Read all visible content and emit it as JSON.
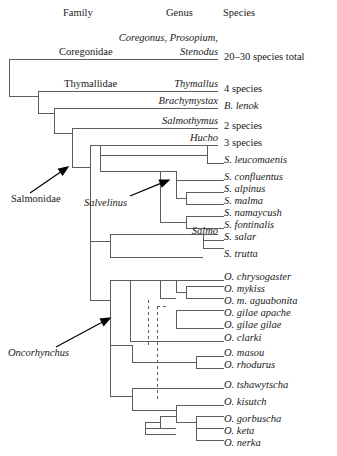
{
  "figure": {
    "width": 337,
    "height": 456,
    "line_color": "#5c5c5c",
    "arrow_color": "#000000",
    "text_color": "#1a1a1a"
  },
  "headers": [
    {
      "label": "Family",
      "x": 63,
      "y": 16
    },
    {
      "label": "Genus",
      "x": 166,
      "y": 16
    },
    {
      "label": "Species",
      "x": 223,
      "y": 16
    }
  ],
  "family_labels": [
    {
      "label": "Coregonidae",
      "x": 59,
      "y": 55
    },
    {
      "label": "Thymallidae",
      "x": 64,
      "y": 87
    }
  ],
  "genus_labels": [
    {
      "label": "Coregonus, Prosopium,",
      "x": 218,
      "y": 41,
      "anchor": "end"
    },
    {
      "label": "Stenodus",
      "x": 218,
      "y": 55,
      "anchor": "end"
    },
    {
      "label": "Thymallus",
      "x": 218,
      "y": 87,
      "anchor": "end"
    },
    {
      "label": "Brachymystax",
      "x": 218,
      "y": 104,
      "anchor": "end"
    },
    {
      "label": "Salmothymus",
      "x": 218,
      "y": 124,
      "anchor": "end"
    },
    {
      "label": "Hucho",
      "x": 218,
      "y": 141,
      "anchor": "end"
    },
    {
      "label": "Salmo",
      "x": 218,
      "y": 234,
      "anchor": "end"
    }
  ],
  "underlines": [
    {
      "x1": 9,
      "x2": 218,
      "y": 59
    },
    {
      "x1": 38,
      "x2": 218,
      "y": 91
    },
    {
      "x1": 54,
      "x2": 218,
      "y": 108
    },
    {
      "x1": 72,
      "x2": 218,
      "y": 128
    },
    {
      "x1": 100,
      "x2": 218,
      "y": 145
    }
  ],
  "species_labels": [
    {
      "label": "20–30 species total",
      "y": 60,
      "style": "count"
    },
    {
      "label": "4 species",
      "y": 92,
      "style": "count"
    },
    {
      "label": "B. lenok",
      "y": 109,
      "style": "species"
    },
    {
      "label": "2 species",
      "y": 129,
      "style": "count"
    },
    {
      "label": "3 species",
      "y": 146,
      "style": "count"
    },
    {
      "label": "S. leucomaenis",
      "y": 163,
      "style": "species"
    },
    {
      "label": "S. confluentus",
      "y": 180,
      "style": "species"
    },
    {
      "label": "S. alpinus",
      "y": 192,
      "style": "species"
    },
    {
      "label": "S. malma",
      "y": 204,
      "style": "species"
    },
    {
      "label": "S. namaycush",
      "y": 216,
      "style": "species"
    },
    {
      "label": "S. fontinalis",
      "y": 228,
      "style": "species"
    },
    {
      "label": "S. salar",
      "y": 240,
      "style": "species"
    },
    {
      "label": "S. trutta",
      "y": 257,
      "style": "species"
    },
    {
      "label": "O. chrysogaster",
      "y": 280,
      "style": "species"
    },
    {
      "label": "O. mykiss",
      "y": 292,
      "style": "species"
    },
    {
      "label": "O. m. aguabonita",
      "y": 304,
      "style": "species"
    },
    {
      "label": "O. gilae apache",
      "y": 316,
      "style": "species"
    },
    {
      "label": "O. gilae gilae",
      "y": 328,
      "style": "species"
    },
    {
      "label": "O. clarki",
      "y": 341,
      "style": "species"
    },
    {
      "label": "O. masou",
      "y": 356,
      "style": "species"
    },
    {
      "label": "O. rhodurus",
      "y": 368,
      "style": "species"
    },
    {
      "label": "O. tshawytscha",
      "y": 388,
      "style": "species"
    },
    {
      "label": "O. kisutch",
      "y": 405,
      "style": "species"
    },
    {
      "label": "O. gorbuscha",
      "y": 422,
      "style": "species"
    },
    {
      "label": "O. keta",
      "y": 434,
      "style": "species"
    },
    {
      "label": "O. nerka",
      "y": 446,
      "style": "species"
    }
  ],
  "species_label_x": 224,
  "callouts": [
    {
      "label": "Salmonidae",
      "style": "upright",
      "text_x": 11,
      "text_y": 202,
      "arrow_from_x": 30,
      "arrow_from_y": 193,
      "arrow_to_x": 68,
      "arrow_to_y": 167
    },
    {
      "label": "Salvelinus",
      "style": "italic",
      "text_x": 84,
      "text_y": 206,
      "arrow_from_x": 130,
      "arrow_from_y": 196,
      "arrow_to_x": 169,
      "arrow_to_y": 180
    },
    {
      "label": "Oncorhynchus",
      "style": "italic",
      "text_x": 8,
      "text_y": 356,
      "arrow_from_x": 56,
      "arrow_from_y": 347,
      "arrow_to_x": 110,
      "arrow_to_y": 318
    }
  ],
  "tree_paths": [
    "M9,59 L9,96",
    "M9,96 L38,96",
    "M38,91 L38,113",
    "M38,113 L54,113",
    "M54,108 L54,133",
    "M54,133 L72,133",
    "M72,128 L72,167",
    "M72,167 L90,167",
    "M90,145 L90,241",
    "M90,145 L100,145",
    "M100,145 L100,155",
    "M100,155 L207,155",
    "M207,145 L207,163",
    "M207,163 L224,163",
    "M207,145 L218,145",
    "M100,155 L100,171",
    "M100,171 L160,171",
    "M160,171 L160,222",
    "M160,171 L176,171",
    "M176,171 L176,180",
    "M176,180 L224,180",
    "M176,171 L176,198",
    "M176,198 L186,198",
    "M186,192 L186,204",
    "M186,192 L224,192",
    "M186,204 L224,204",
    "M160,222 L186,222",
    "M186,216 L186,228",
    "M186,216 L224,216",
    "M186,228 L224,228",
    "M90,241 L110,241",
    "M110,234 L110,248",
    "M110,234 L203,234",
    "M203,234 L203,248",
    "M203,234 L218,234",
    "M203,240 L224,240",
    "M203,248 L224,248",
    "M110,248 L110,257",
    "M110,257 L203,257",
    "M90,241 L90,300",
    "M90,300 L110,300",
    "M110,280 L110,345",
    "M110,280 L130,280",
    "M130,280 L130,322",
    "M130,280 L160,280",
    "M160,280 L160,298",
    "M160,280 L176,280",
    "M176,280 L176,292",
    "M176,280 L224,280",
    "M176,292 L186,292",
    "M186,286 L186,298",
    "M186,286 L224,286",
    "M186,298 L224,298",
    "M160,298 L176,298",
    "M176,310 L176,328",
    "M176,310 L224,310",
    "M176,328 L224,328",
    "M130,322 L130,341",
    "M130,341 L224,341",
    "M110,345 L110,396",
    "M110,345 L132,345",
    "M132,345 L132,362",
    "M132,362 L196,362",
    "M196,356 L196,368",
    "M196,356 L224,356",
    "M196,368 L224,368",
    "M110,396 L132,396",
    "M132,388 L132,410",
    "M132,388 L176,388",
    "M176,388 L224,388",
    "M132,410 L176,410",
    "M176,405 L176,422",
    "M176,405 L224,405",
    "M176,422 L196,422",
    "M196,416 L196,440",
    "M196,416 L224,416",
    "M196,428 L224,428",
    "M196,440 L224,440",
    "M145,422 L145,434",
    "M145,428 L176,428",
    "M145,434 L176,434",
    "M145,422 L160,422",
    "M160,416 L160,428",
    "M160,416 L176,416"
  ],
  "dashed_paths": [
    "M148,300 L148,348",
    "M157,306 L157,400",
    "M157,306 L168,306"
  ]
}
